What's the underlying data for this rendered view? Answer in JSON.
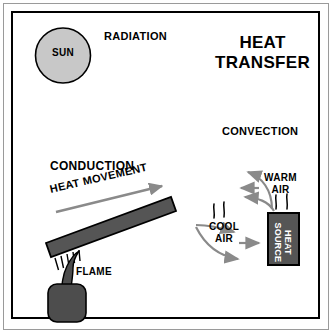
{
  "figure": {
    "title_line1": "HEAT",
    "title_line2": "TRANSFER",
    "title_full": "HEAT TRANSFER"
  },
  "colors": {
    "page_background": "#ffffff",
    "outer_frame": "#9a9a9a",
    "inner_frame": "#000000",
    "sun_fill": "#c8c8c8",
    "sun_stroke": "#000000",
    "bar_fill": "#555555",
    "bar_stroke": "#000000",
    "heat_source_fill": "#555555",
    "heat_source_stroke": "#000000",
    "heat_source_text": "#ffffff",
    "flame_fill": "#4d4d4d",
    "arrow_gray": "#8a8a8a",
    "text": "#000000"
  },
  "radiation": {
    "section_label": "RADIATION",
    "sun_label": "SUN"
  },
  "conduction": {
    "section_label": "CONDUCTION",
    "arrow_label": "HEAT MOVEMENT",
    "flame_label": "FLAME"
  },
  "convection": {
    "section_label": "CONVECTION",
    "warm_air_line1": "WARM",
    "warm_air_line2": "AIR",
    "cool_air_line1": "COOL",
    "cool_air_line2": "AIR",
    "heat_source_line1": "HEAT",
    "heat_source_line2": "SOURCE"
  }
}
